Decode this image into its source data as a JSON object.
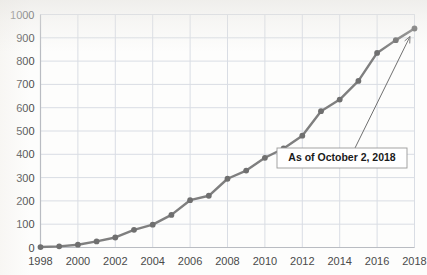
{
  "chart_data": {
    "type": "line",
    "title": "",
    "subtitle": "",
    "xlabel": "",
    "ylabel": "",
    "xlim": [
      1998,
      2018
    ],
    "ylim": [
      0,
      1000
    ],
    "grid": true,
    "legend": null,
    "legend_position": "none",
    "x": [
      1998,
      1999,
      2000,
      2001,
      2002,
      2003,
      2004,
      2005,
      2006,
      2007,
      2008,
      2009,
      2010,
      2011,
      2012,
      2013,
      2014,
      2015,
      2016,
      2017,
      2018
    ],
    "series": [
      {
        "name": "Cumulative total",
        "values": [
          2,
          5,
          12,
          26,
          43,
          76,
          98,
          140,
          203,
          222,
          295,
          330,
          385,
          425,
          480,
          585,
          635,
          715,
          835,
          890,
          940
        ],
        "color": "#7f7f7f",
        "marker": "circle",
        "marker_color": "#6f6f6f"
      }
    ],
    "xticks": [
      1998,
      2000,
      2002,
      2004,
      2006,
      2008,
      2010,
      2012,
      2014,
      2016,
      2018
    ],
    "xtick_labels": [
      "1998",
      "2000",
      "2002",
      "2004",
      "2006",
      "2008",
      "2010",
      "2012",
      "2014",
      "2016",
      "2018"
    ],
    "yticks": [
      0,
      100,
      200,
      300,
      400,
      500,
      600,
      700,
      800,
      900,
      1000
    ],
    "ytick_labels": [
      "0",
      "100",
      "200",
      "300",
      "400",
      "500",
      "600",
      "700",
      "800",
      "900",
      "1000"
    ],
    "annotations": [
      {
        "text": "As of October 2, 2018",
        "points_to_x": 2018,
        "points_to_y": 940
      }
    ]
  },
  "style": {
    "line_color": "#7f7f7f",
    "marker_color": "#6f6f6f",
    "grid_color": "#d9dde4",
    "axis_color": "#b9bcc2",
    "tick_label_color": "#4a4a4a",
    "annotation_border_color": "#9a9a9a",
    "annotation_fill": "#ffffff",
    "arrow_color": "#6f6f6f",
    "background": "#fdfdfc"
  }
}
